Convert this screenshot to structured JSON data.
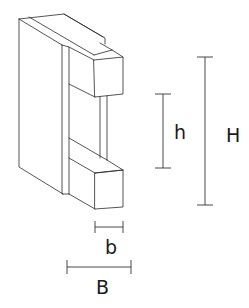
{
  "diagram": {
    "colors": {
      "line": "#2a2a2a",
      "background": "#ffffff"
    },
    "labels": {
      "inner_height": "h",
      "outer_height": "H",
      "flange_width": "b",
      "total_width": "B"
    },
    "dimensions": [
      {
        "name": "h",
        "orientation": "vertical",
        "meaning": "inner height between flanges"
      },
      {
        "name": "H",
        "orientation": "vertical",
        "meaning": "total height"
      },
      {
        "name": "b",
        "orientation": "horizontal",
        "meaning": "flange width"
      },
      {
        "name": "B",
        "orientation": "horizontal",
        "meaning": "total width"
      }
    ]
  }
}
